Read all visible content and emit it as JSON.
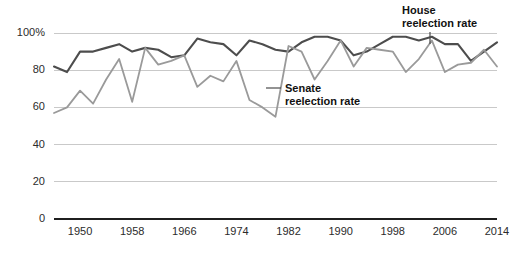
{
  "chart_data": {
    "type": "line",
    "title": "",
    "xlabel": "",
    "ylabel": "",
    "xlim": [
      1946,
      2014
    ],
    "ylim": [
      0,
      100
    ],
    "grid": true,
    "legend_position": "inline-annotations",
    "x": [
      1946,
      1948,
      1950,
      1952,
      1954,
      1956,
      1958,
      1960,
      1962,
      1964,
      1966,
      1968,
      1970,
      1972,
      1974,
      1976,
      1978,
      1980,
      1982,
      1984,
      1986,
      1988,
      1990,
      1992,
      1994,
      1996,
      1998,
      2000,
      2002,
      2004,
      2006,
      2008,
      2010,
      2012,
      2014
    ],
    "xticks": [
      1950,
      1958,
      1966,
      1974,
      1982,
      1990,
      1998,
      2006,
      2014
    ],
    "xtick_labels": [
      "1950",
      "1958",
      "1966",
      "1974",
      "1982",
      "1990",
      "1998",
      "2006",
      "2014"
    ],
    "yticks": [
      0,
      20,
      40,
      60,
      80,
      100
    ],
    "ytick_labels": [
      "0",
      "20",
      "40",
      "60",
      "80",
      "100%"
    ],
    "series": [
      {
        "name": "House reelection rate",
        "color": "#4d4d4d",
        "width": 2.1,
        "values": [
          82,
          79,
          90,
          90,
          92,
          94,
          90,
          92,
          91,
          87,
          88,
          97,
          95,
          94,
          88,
          96,
          94,
          91,
          90,
          95,
          98,
          98,
          96,
          88,
          90,
          94,
          98,
          98,
          96,
          98,
          94,
          94,
          85,
          90,
          95
        ]
      },
      {
        "name": "Senate reelection rate",
        "color": "#9a9a9a",
        "width": 1.8,
        "values": [
          57,
          60,
          69,
          62,
          75,
          86,
          63,
          92,
          83,
          85,
          88,
          71,
          77,
          74,
          85,
          64,
          60,
          55,
          93,
          90,
          75,
          85,
          96,
          82,
          92,
          91,
          90,
          79,
          86,
          96,
          79,
          83,
          84,
          91,
          82
        ]
      }
    ],
    "annotations": [
      {
        "id": "house-annotation",
        "line1": "House",
        "line2": "reelection rate",
        "text_x": 402,
        "text_y": 14,
        "leader": "M 430 32 L 430 44"
      },
      {
        "id": "senate-annotation",
        "line1": "Senate",
        "line2": "reelection rate",
        "text_x": 285,
        "text_y": 92,
        "leader": "M 266 88 L 281 88"
      }
    ]
  }
}
